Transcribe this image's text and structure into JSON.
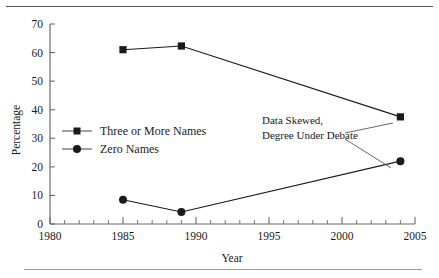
{
  "figure": {
    "top_rule": "horizontal-rule",
    "bottom_rule": "horizontal-rule"
  },
  "chart_data": {
    "type": "line",
    "title": "",
    "xlabel": "Year",
    "ylabel": "Percentage",
    "xlim": [
      1980,
      2005
    ],
    "ylim": [
      0,
      70
    ],
    "xticks": [
      1980,
      1985,
      1990,
      1995,
      2000,
      2005
    ],
    "xtick_labels": [
      "1980",
      "1985",
      "1990",
      "1995",
      "2000",
      "2005"
    ],
    "x_minor_tick_interval": 1,
    "yticks": [
      0,
      10,
      20,
      30,
      40,
      50,
      60,
      70
    ],
    "ytick_labels": [
      "0",
      "10",
      "20",
      "30",
      "40",
      "50",
      "60",
      "70"
    ],
    "grid": false,
    "legend_position": "center-left-inside",
    "x": [
      1985,
      1989,
      2004
    ],
    "series": [
      {
        "name": "Three or More Names",
        "marker": "square",
        "color": "#1a1a1a",
        "values": [
          61,
          62.3,
          37.5
        ]
      },
      {
        "name": "Zero Names",
        "marker": "circle",
        "color": "#1a1a1a",
        "values": [
          8.5,
          4.2,
          22
        ]
      }
    ],
    "annotations": [
      {
        "text_line_1": "Data Skewed,",
        "text_line_2": "Degree Under Debate",
        "points_to": [
          "Three or More Names 2004",
          "Zero Names 2004"
        ]
      }
    ]
  },
  "axis_labels": {
    "x_title": "Year",
    "y_title": "Percentage"
  },
  "legend": {
    "items": [
      {
        "label": "Three or More Names",
        "marker": "square"
      },
      {
        "label": "Zero Names",
        "marker": "circle"
      }
    ]
  },
  "annotation": {
    "line1": "Data Skewed,",
    "line2": "Degree Under Debate"
  },
  "ticks": {
    "x": [
      "1980",
      "1985",
      "1990",
      "1995",
      "2000",
      "2005"
    ],
    "y": [
      "0",
      "10",
      "20",
      "30",
      "40",
      "50",
      "60",
      "70"
    ]
  }
}
